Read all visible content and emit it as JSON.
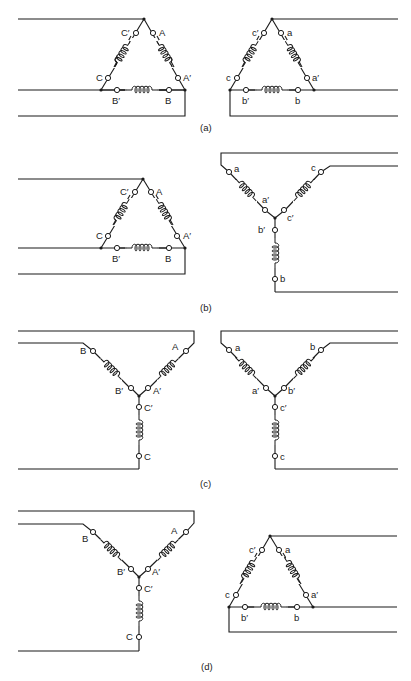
{
  "figure": {
    "panels": [
      {
        "id": "a",
        "caption": "(a)",
        "primary": {
          "type": "delta",
          "terminals": [
            "A",
            "A′",
            "B",
            "B′",
            "C",
            "C′"
          ]
        },
        "secondary": {
          "type": "delta",
          "terminals": [
            "a",
            "a′",
            "b",
            "b′",
            "c",
            "c′"
          ]
        }
      },
      {
        "id": "b",
        "caption": "(b)",
        "primary": {
          "type": "delta",
          "terminals": [
            "A",
            "A′",
            "B",
            "B′",
            "C",
            "C′"
          ]
        },
        "secondary": {
          "type": "wye",
          "terminals": [
            "a",
            "a′",
            "b",
            "b′",
            "c",
            "c′"
          ]
        }
      },
      {
        "id": "c",
        "caption": "(c)",
        "primary": {
          "type": "wye",
          "terminals": [
            "A",
            "A′",
            "B",
            "B′",
            "C",
            "C′"
          ]
        },
        "secondary": {
          "type": "wye",
          "terminals": [
            "a",
            "a′",
            "b",
            "b′",
            "c",
            "c′"
          ]
        }
      },
      {
        "id": "d",
        "caption": "(d)",
        "primary": {
          "type": "wye",
          "terminals": [
            "A",
            "A′",
            "B",
            "B′",
            "C",
            "C′"
          ]
        },
        "secondary": {
          "type": "delta",
          "terminals": [
            "a",
            "a′",
            "b",
            "b′",
            "c",
            "c′"
          ]
        }
      }
    ]
  },
  "labels": {
    "A": "A",
    "Ap": "A′",
    "B": "B",
    "Bp": "B′",
    "C": "C",
    "Cp": "C′",
    "a": "a",
    "ap": "a′",
    "b": "b",
    "bp": "b′",
    "c": "c",
    "cp": "c′"
  },
  "captions": {
    "a": "(a)",
    "b": "(b)",
    "c": "(c)",
    "d": "(d)"
  },
  "colors": {
    "ink": "#1a1a1a",
    "background": "#ffffff"
  }
}
